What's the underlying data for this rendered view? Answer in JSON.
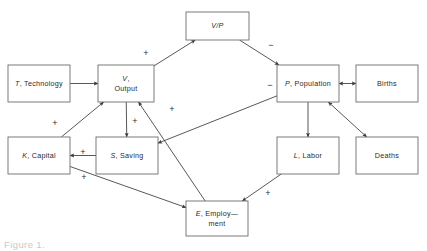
{
  "figure": {
    "caption": "Figure 1."
  },
  "nodes": [
    {
      "id": "vp",
      "var": "V/P",
      "sep": "",
      "rest": "",
      "line2": "",
      "x": 186,
      "y": 12,
      "w": 63,
      "h": 28
    },
    {
      "id": "technology",
      "var": "T",
      "sep": ", ",
      "rest": "Technology",
      "line2": "",
      "x": 8,
      "y": 65,
      "w": 62,
      "h": 37
    },
    {
      "id": "output",
      "var": "V",
      "sep": ",",
      "rest": "",
      "line2": "Output",
      "x": 98,
      "y": 65,
      "w": 56,
      "h": 37
    },
    {
      "id": "population",
      "var": "P",
      "sep": ", ",
      "rest": "Population",
      "line2": "",
      "x": 277,
      "y": 65,
      "w": 62,
      "h": 37
    },
    {
      "id": "births",
      "var": "",
      "sep": "",
      "rest": "Births",
      "line2": "",
      "x": 356,
      "y": 65,
      "w": 62,
      "h": 37
    },
    {
      "id": "capital",
      "var": "K",
      "sep": ", ",
      "rest": "Capital",
      "line2": "",
      "x": 8,
      "y": 137,
      "w": 62,
      "h": 37
    },
    {
      "id": "saving",
      "var": "S",
      "sep": ", ",
      "rest": "Saving",
      "line2": "",
      "x": 96,
      "y": 137,
      "w": 62,
      "h": 37
    },
    {
      "id": "labor",
      "var": "L",
      "sep": ", ",
      "rest": "Labor",
      "line2": "",
      "x": 277,
      "y": 137,
      "w": 62,
      "h": 37
    },
    {
      "id": "deaths",
      "var": "",
      "sep": "",
      "rest": "Deaths",
      "line2": "",
      "x": 356,
      "y": 137,
      "w": 62,
      "h": 37
    },
    {
      "id": "employment",
      "var": "E",
      "sep": ", ",
      "rest": "Employ—",
      "line2": "ment",
      "x": 186,
      "y": 201,
      "w": 62,
      "h": 35
    }
  ],
  "edges": [
    {
      "id": "tech-to-output",
      "from": "technology",
      "to": "output",
      "sign": "",
      "arrows": "end"
    },
    {
      "id": "output-to-vp",
      "from": "output",
      "to": "vp",
      "sign": "+",
      "arrows": "end"
    },
    {
      "id": "vp-to-population",
      "from": "vp",
      "to": "population",
      "sign": "−",
      "arrows": "end"
    },
    {
      "id": "output-to-saving",
      "from": "output",
      "to": "saving",
      "sign": "+",
      "arrows": "end"
    },
    {
      "id": "saving-to-capital",
      "from": "saving",
      "to": "capital",
      "sign": "+",
      "arrows": "end"
    },
    {
      "id": "capital-to-output",
      "from": "capital",
      "to": "output",
      "sign": "+",
      "arrows": "end"
    },
    {
      "id": "capital-to-employment",
      "from": "capital",
      "to": "employment",
      "sign": "+",
      "arrows": "end"
    },
    {
      "id": "employment-to-output",
      "from": "employment",
      "to": "output",
      "sign": "+",
      "arrows": "end"
    },
    {
      "id": "population-to-saving",
      "from": "population",
      "to": "saving",
      "sign": "−",
      "arrows": "end"
    },
    {
      "id": "population-to-births",
      "from": "population",
      "to": "births",
      "sign": "",
      "arrows": "both"
    },
    {
      "id": "population-to-deaths",
      "from": "population",
      "to": "deaths",
      "sign": "",
      "arrows": "both"
    },
    {
      "id": "population-to-labor",
      "from": "population",
      "to": "labor",
      "sign": "",
      "arrows": "end"
    },
    {
      "id": "labor-to-employment",
      "from": "labor",
      "to": "employment",
      "sign": "+",
      "arrows": "end"
    }
  ],
  "signs": [
    {
      "id": "sign-output-vp",
      "text": "+",
      "x": 146,
      "y": 54
    },
    {
      "id": "sign-vp-population",
      "text": "−",
      "x": 271,
      "y": 46
    },
    {
      "id": "sign-population-left",
      "text": "−",
      "x": 270,
      "y": 86
    },
    {
      "id": "sign-output-saving",
      "text": "+",
      "x": 135,
      "y": 122
    },
    {
      "id": "sign-saving-capital",
      "text": "+",
      "x": 83,
      "y": 153
    },
    {
      "id": "sign-capital-output",
      "text": "+",
      "x": 55,
      "y": 124
    },
    {
      "id": "sign-capital-employment",
      "text": "+",
      "x": 84,
      "y": 178
    },
    {
      "id": "sign-employment-output",
      "text": "+",
      "x": 172,
      "y": 110
    },
    {
      "id": "sign-labor-employment",
      "text": "+",
      "x": 268,
      "y": 194
    }
  ],
  "colors": {
    "box_stroke": "#6d6d6d",
    "line": "#3a3a3a",
    "text": "#2b2b2b",
    "background": "#ffffff",
    "caption": "#c9c9c9"
  }
}
